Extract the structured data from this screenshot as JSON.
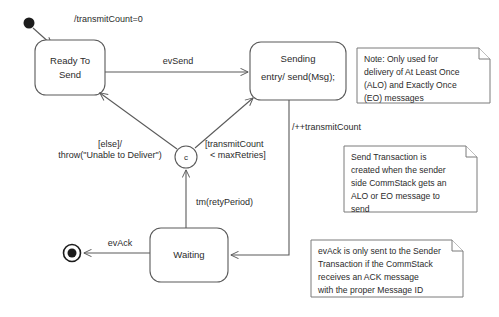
{
  "diagram": {
    "kind": "uml-state-machine",
    "background_color": "#ffffff",
    "line_color": "#5a5a5a",
    "text_color": "#2b2b2b"
  },
  "nodes": {
    "initial": {
      "type": "initial-pseudostate",
      "cx": 29,
      "cy": 23,
      "r": 5.5
    },
    "final": {
      "type": "final-state",
      "cx": 72,
      "cy": 253,
      "r_outer": 8.5,
      "r_inner": 4.5
    },
    "choice": {
      "type": "choice-pseudostate",
      "label": "c",
      "cx": 186,
      "cy": 157,
      "r": 11
    },
    "ready_to_send": {
      "name_line1": "Ready To",
      "name_line2": "Send",
      "x": 35,
      "y": 40,
      "w": 70,
      "h": 55,
      "rx": 11
    },
    "sending": {
      "name": "Sending",
      "entry": "entry/ send(Msg);",
      "x": 250,
      "y": 42,
      "w": 96,
      "h": 58,
      "rx": 11
    },
    "waiting": {
      "name": "Waiting",
      "x": 150,
      "y": 228,
      "w": 78,
      "h": 54,
      "rx": 11
    }
  },
  "transitions": [
    {
      "id": "init-to-ready",
      "label": "/transmitCount=0",
      "label_x": 74,
      "label_y": 22,
      "anchor": "start"
    },
    {
      "id": "ready-to-sending",
      "label": "evSend",
      "label_x": 178,
      "label_y": 64,
      "anchor": "mid"
    },
    {
      "id": "sending-to-waiting",
      "label": "/++transmitCount",
      "label_x": 292,
      "label_y": 130,
      "anchor": "start"
    },
    {
      "id": "waiting-to-choice",
      "label": "tm(retyPeriod)",
      "label_x": 196,
      "label_y": 205,
      "anchor": "start"
    },
    {
      "id": "choice-to-ready-else-l1",
      "label": "[else]/",
      "label_x": 110,
      "label_y": 147,
      "anchor": "mid"
    },
    {
      "id": "choice-to-ready-else-l2",
      "label": "throw(\"Unable to Deliver\")",
      "label_x": 110,
      "label_y": 158,
      "anchor": "mid"
    },
    {
      "id": "choice-to-sending-guard-l1",
      "label": "[transmitCount",
      "label_x": 205,
      "label_y": 147,
      "anchor": "start"
    },
    {
      "id": "choice-to-sending-guard-l2",
      "label": "< maxRetries]",
      "label_x": 210,
      "label_y": 158,
      "anchor": "start"
    },
    {
      "id": "waiting-to-final",
      "label": "evAck",
      "label_x": 120,
      "label_y": 246,
      "anchor": "mid"
    }
  ],
  "notes": [
    {
      "id": "note-alo-eo",
      "x": 357,
      "y": 48,
      "w": 133,
      "h": 55,
      "fold": 11,
      "lines": [
        "Note: Only used for",
        "delivery of At Least Once",
        "(ALO) and Exactly Once",
        "(EO) messages"
      ]
    },
    {
      "id": "note-send-transaction",
      "x": 344,
      "y": 146,
      "w": 133,
      "h": 66,
      "fold": 11,
      "lines": [
        "Send Transaction is",
        "created when the sender",
        "side CommStack gets an",
        "ALO or EO message to",
        "send"
      ]
    },
    {
      "id": "note-evack",
      "x": 311,
      "y": 240,
      "w": 152,
      "h": 57,
      "fold": 11,
      "lines": [
        "evAck is only sent to the Sender",
        "Transaction if the CommStack",
        "receives an ACK message",
        "with the proper Message ID"
      ]
    }
  ]
}
